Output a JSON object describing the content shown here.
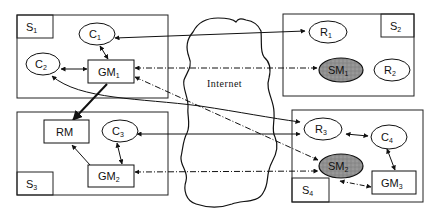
{
  "diagram": {
    "cloud_label": "Internet",
    "sites": [
      {
        "id": "S1",
        "label": "S",
        "sub": "1"
      },
      {
        "id": "S2",
        "label": "S",
        "sub": "2"
      },
      {
        "id": "S3",
        "label": "S",
        "sub": "3"
      },
      {
        "id": "S4",
        "label": "S",
        "sub": "4"
      }
    ],
    "nodes": {
      "C1": {
        "label": "C",
        "sub": "1",
        "shape": "ellipse"
      },
      "C2": {
        "label": "C",
        "sub": "2",
        "shape": "ellipse"
      },
      "GM1": {
        "label": "GM",
        "sub": "1",
        "shape": "rect"
      },
      "R1": {
        "label": "R",
        "sub": "1",
        "shape": "ellipse"
      },
      "SM1": {
        "label": "SM",
        "sub": "1",
        "shape": "ellipse-shaded"
      },
      "R2": {
        "label": "R",
        "sub": "2",
        "shape": "ellipse"
      },
      "RM": {
        "label": "RM",
        "sub": "",
        "shape": "rect"
      },
      "C3": {
        "label": "C",
        "sub": "3",
        "shape": "ellipse"
      },
      "GM2": {
        "label": "GM",
        "sub": "2",
        "shape": "rect"
      },
      "R3": {
        "label": "R",
        "sub": "3",
        "shape": "ellipse"
      },
      "C4": {
        "label": "C",
        "sub": "4",
        "shape": "ellipse"
      },
      "SM2": {
        "label": "SM",
        "sub": "2",
        "shape": "ellipse-shaded"
      },
      "GM3": {
        "label": "GM",
        "sub": "3",
        "shape": "rect"
      }
    },
    "edges": [
      {
        "from": "R1",
        "to": "C1",
        "style": "solid",
        "arrow": "both"
      },
      {
        "from": "C1",
        "to": "GM1",
        "style": "solid",
        "arrow": "both"
      },
      {
        "from": "C2",
        "to": "GM1",
        "style": "solid",
        "arrow": "both"
      },
      {
        "from": "GM1",
        "to": "SM1",
        "style": "dash-dot",
        "arrow": "both"
      },
      {
        "from": "GM1",
        "to": "SM2",
        "style": "dash-dot",
        "arrow": "both"
      },
      {
        "from": "C2",
        "to": "R3",
        "style": "solid",
        "arrow": "both"
      },
      {
        "from": "GM1",
        "to": "RM",
        "style": "solid-bold",
        "arrow": "end"
      },
      {
        "from": "C3",
        "to": "R3",
        "style": "solid",
        "arrow": "both"
      },
      {
        "from": "C3",
        "to": "GM2",
        "style": "solid",
        "arrow": "both"
      },
      {
        "from": "GM2",
        "to": "RM",
        "style": "solid",
        "arrow": "end"
      },
      {
        "from": "GM2",
        "to": "SM2",
        "style": "dash-dot",
        "arrow": "both"
      },
      {
        "from": "R3",
        "to": "C4",
        "style": "solid",
        "arrow": "both"
      },
      {
        "from": "C4",
        "to": "GM3",
        "style": "solid",
        "arrow": "both"
      },
      {
        "from": "SM2",
        "to": "GM3",
        "style": "dash-dot",
        "arrow": "both"
      }
    ],
    "colors": {
      "line": "#111111",
      "shaded_fill": "#8f8f8f",
      "background": "#ffffff"
    }
  }
}
